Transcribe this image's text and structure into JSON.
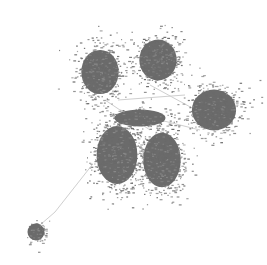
{
  "diagram": {
    "type": "network-graph",
    "width": 267,
    "height": 265,
    "background": "#ffffff",
    "node_color": "#6b6b6b",
    "edge_color": "#cfcfcf",
    "label_color": "#8a8a8a",
    "clusters": [
      {
        "id": "top-left",
        "cx": 100,
        "cy": 72,
        "rx": 22,
        "ry": 26,
        "n": 520
      },
      {
        "id": "top-center",
        "cx": 158,
        "cy": 60,
        "rx": 22,
        "ry": 24,
        "n": 480
      },
      {
        "id": "right",
        "cx": 214,
        "cy": 110,
        "rx": 26,
        "ry": 24,
        "n": 460
      },
      {
        "id": "bottom-left-main",
        "cx": 117,
        "cy": 155,
        "rx": 24,
        "ry": 34,
        "n": 620
      },
      {
        "id": "bottom-center-main",
        "cx": 162,
        "cy": 160,
        "rx": 22,
        "ry": 32,
        "n": 560
      },
      {
        "id": "middle-bridge",
        "cx": 140,
        "cy": 118,
        "rx": 30,
        "ry": 10,
        "n": 120
      },
      {
        "id": "small-outlier",
        "cx": 36,
        "cy": 232,
        "rx": 10,
        "ry": 10,
        "n": 90
      }
    ],
    "edges": [
      {
        "from": [
          92,
          165
        ],
        "to": [
          55,
          212
        ]
      },
      {
        "from": [
          55,
          212
        ],
        "to": [
          40,
          225
        ]
      },
      {
        "from": [
          118,
          100
        ],
        "to": [
          185,
          95
        ]
      },
      {
        "from": [
          150,
          85
        ],
        "to": [
          205,
          115
        ]
      },
      {
        "from": [
          120,
          110
        ],
        "to": [
          200,
          130
        ]
      },
      {
        "from": [
          105,
          100
        ],
        "to": [
          150,
          130
        ]
      }
    ]
  }
}
